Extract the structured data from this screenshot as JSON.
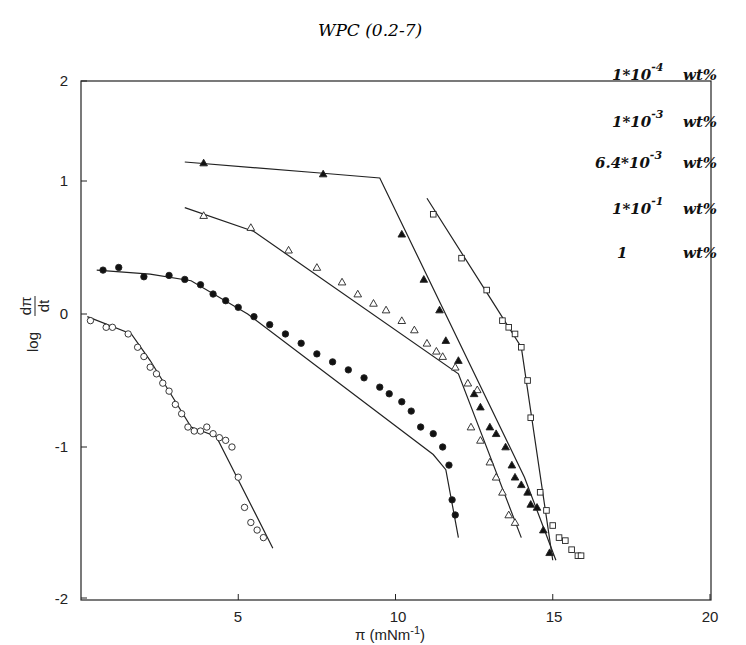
{
  "chart_data": {
    "type": "scatter",
    "title": "WPC (0.2-7)",
    "xlabel": "π (mNm⁻¹)",
    "ylabel": "log dπ/dt",
    "xlim": [
      0,
      20
    ],
    "ylim": [
      -2,
      2
    ],
    "xticks": [
      5,
      10,
      15,
      20
    ],
    "yticks": [
      2,
      1,
      0,
      -1,
      -2
    ],
    "grid": false,
    "legend_position": "upper right (text only)",
    "legend": [
      "1*10^-4 wt%",
      "1*10^-3 wt%",
      "6.4*10^-3 wt%",
      "1*10^-1 wt%",
      "1 wt%"
    ],
    "series": [
      {
        "name": "open circles",
        "marker": "circle-open",
        "points": [
          [
            0.3,
            -0.05
          ],
          [
            0.8,
            -0.1
          ],
          [
            1.0,
            -0.1
          ],
          [
            1.5,
            -0.15
          ],
          [
            1.8,
            -0.25
          ],
          [
            2.0,
            -0.32
          ],
          [
            2.2,
            -0.4
          ],
          [
            2.4,
            -0.45
          ],
          [
            2.6,
            -0.52
          ],
          [
            2.8,
            -0.58
          ],
          [
            3.0,
            -0.68
          ],
          [
            3.2,
            -0.75
          ],
          [
            3.4,
            -0.85
          ],
          [
            3.6,
            -0.88
          ],
          [
            3.8,
            -0.88
          ],
          [
            4.0,
            -0.85
          ],
          [
            4.2,
            -0.9
          ],
          [
            4.4,
            -0.93
          ],
          [
            4.6,
            -0.95
          ],
          [
            4.8,
            -1.0
          ],
          [
            5.0,
            -1.2
          ],
          [
            5.2,
            -1.4
          ],
          [
            5.4,
            -1.5
          ],
          [
            5.6,
            -1.55
          ],
          [
            5.8,
            -1.6
          ]
        ],
        "fit": [
          [
            0.2,
            -0.02
          ],
          [
            1.6,
            -0.15
          ],
          [
            2.2,
            -0.35
          ],
          [
            3.5,
            -0.85
          ],
          [
            4.3,
            -0.92
          ],
          [
            6.1,
            -1.67
          ]
        ]
      },
      {
        "name": "filled circles",
        "marker": "circle-filled",
        "points": [
          [
            0.7,
            0.33
          ],
          [
            1.2,
            0.35
          ],
          [
            2.0,
            0.28
          ],
          [
            2.8,
            0.29
          ],
          [
            3.3,
            0.26
          ],
          [
            3.8,
            0.22
          ],
          [
            4.2,
            0.15
          ],
          [
            4.6,
            0.1
          ],
          [
            5.0,
            0.05
          ],
          [
            5.5,
            -0.02
          ],
          [
            6.0,
            -0.08
          ],
          [
            6.5,
            -0.15
          ],
          [
            7.0,
            -0.22
          ],
          [
            7.5,
            -0.3
          ],
          [
            8.0,
            -0.36
          ],
          [
            8.5,
            -0.42
          ],
          [
            9.0,
            -0.48
          ],
          [
            9.5,
            -0.55
          ],
          [
            9.8,
            -0.6
          ],
          [
            10.2,
            -0.66
          ],
          [
            10.5,
            -0.73
          ],
          [
            10.8,
            -0.85
          ],
          [
            11.2,
            -0.9
          ],
          [
            11.5,
            -1.0
          ],
          [
            11.7,
            -1.12
          ],
          [
            11.8,
            -1.35
          ],
          [
            11.9,
            -1.45
          ]
        ],
        "fit": [
          [
            0.5,
            0.33
          ],
          [
            2.2,
            0.3
          ],
          [
            3.5,
            0.25
          ],
          [
            5.3,
            0.0
          ],
          [
            11.2,
            -1.05
          ],
          [
            11.6,
            -1.15
          ],
          [
            12.0,
            -1.6
          ]
        ]
      },
      {
        "name": "open triangles",
        "marker": "triangle-open",
        "points": [
          [
            3.9,
            0.74
          ],
          [
            5.4,
            0.65
          ],
          [
            6.6,
            0.48
          ],
          [
            7.5,
            0.35
          ],
          [
            8.3,
            0.24
          ],
          [
            8.8,
            0.15
          ],
          [
            9.3,
            0.08
          ],
          [
            9.7,
            0.03
          ],
          [
            10.2,
            -0.05
          ],
          [
            10.6,
            -0.12
          ],
          [
            11.0,
            -0.22
          ],
          [
            11.3,
            -0.28
          ],
          [
            11.5,
            -0.32
          ],
          [
            11.9,
            -0.4
          ],
          [
            12.3,
            -0.52
          ],
          [
            12.6,
            -0.57
          ],
          [
            12.4,
            -0.85
          ],
          [
            12.7,
            -0.95
          ],
          [
            13.0,
            -1.1
          ],
          [
            13.2,
            -1.2
          ],
          [
            13.4,
            -1.3
          ],
          [
            13.6,
            -1.45
          ],
          [
            13.8,
            -1.5
          ]
        ],
        "fit": [
          [
            3.3,
            0.8
          ],
          [
            5.5,
            0.62
          ],
          [
            12.0,
            -0.45
          ],
          [
            14.0,
            -1.6
          ]
        ]
      },
      {
        "name": "filled triangles",
        "marker": "triangle-filled",
        "points": [
          [
            3.9,
            1.18
          ],
          [
            7.7,
            1.07
          ],
          [
            10.2,
            0.6
          ],
          [
            10.9,
            0.26
          ],
          [
            11.4,
            0.03
          ],
          [
            11.6,
            -0.2
          ],
          [
            12.0,
            -0.35
          ],
          [
            12.5,
            -0.6
          ],
          [
            12.7,
            -0.7
          ],
          [
            13.0,
            -0.85
          ],
          [
            13.2,
            -0.9
          ],
          [
            13.5,
            -1.0
          ],
          [
            13.7,
            -1.12
          ],
          [
            13.8,
            -1.2
          ],
          [
            14.0,
            -1.25
          ],
          [
            14.2,
            -1.3
          ],
          [
            14.3,
            -1.38
          ],
          [
            14.5,
            -1.4
          ],
          [
            14.7,
            -1.55
          ],
          [
            14.9,
            -1.7
          ]
        ],
        "fit": [
          [
            3.3,
            1.19
          ],
          [
            7.6,
            1.08
          ],
          [
            9.5,
            1.03
          ],
          [
            14.1,
            -1.2
          ],
          [
            15.1,
            -1.75
          ]
        ]
      },
      {
        "name": "open squares",
        "marker": "square-open",
        "points": [
          [
            11.2,
            0.75
          ],
          [
            12.1,
            0.42
          ],
          [
            12.9,
            0.18
          ],
          [
            13.4,
            -0.05
          ],
          [
            13.6,
            -0.1
          ],
          [
            13.8,
            -0.15
          ],
          [
            14.0,
            -0.25
          ],
          [
            14.2,
            -0.5
          ],
          [
            14.3,
            -0.78
          ],
          [
            14.6,
            -1.3
          ],
          [
            14.8,
            -1.42
          ],
          [
            15.0,
            -1.52
          ],
          [
            15.2,
            -1.6
          ],
          [
            15.4,
            -1.62
          ],
          [
            15.6,
            -1.68
          ],
          [
            15.8,
            -1.72
          ],
          [
            15.9,
            -1.72
          ]
        ],
        "fit": [
          [
            11.0,
            0.87
          ],
          [
            13.2,
            0.05
          ],
          [
            14.0,
            -0.25
          ],
          [
            15.0,
            -1.75
          ]
        ]
      }
    ]
  },
  "labels": {
    "title": "WPC (0.2-7)",
    "xlabel_main": "π (mNm",
    "xlabel_sup": "-1",
    "xlabel_end": ")",
    "ylabel_log": "log",
    "ylabel_num": "dπ",
    "ylabel_den": "dt",
    "xticks": [
      "5",
      "10",
      "15",
      "20"
    ],
    "yticks": [
      "2",
      "1",
      "0",
      "-1",
      "-2"
    ],
    "legend": [
      {
        "mant": "1*10",
        "exp": "-4",
        "unit": "wt%"
      },
      {
        "mant": "1*10",
        "exp": "-3",
        "unit": "wt%"
      },
      {
        "mant": "6.4*10",
        "exp": "-3",
        "unit": "wt%"
      },
      {
        "mant": "1*10",
        "exp": "-1",
        "unit": "wt%"
      },
      {
        "mant": "1",
        "exp": "",
        "unit": "wt%"
      }
    ]
  }
}
